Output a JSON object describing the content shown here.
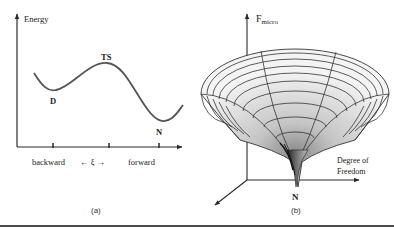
{
  "figure_a": {
    "caption": "(a)",
    "y_axis_label": "Energy",
    "x_axis": {
      "left_label": "backward",
      "center_label": "← ξ →",
      "right_label": "forward"
    },
    "points": {
      "denatured": "D",
      "transition_state": "TS",
      "native": "N"
    }
  },
  "figure_b": {
    "caption": "(b)",
    "y_axis_label_main": "F",
    "y_axis_label_sub": "micro",
    "x_axis_label_line1": "Degree of",
    "x_axis_label_line2": "Freedom",
    "native_label": "N"
  },
  "colors": {
    "ink": "#2a2a2a",
    "funnel_light": "#f2f2f2",
    "funnel_mid": "#c8c8c8",
    "funnel_dark": "#6e6e6e",
    "divider": "#4a4a4a"
  }
}
